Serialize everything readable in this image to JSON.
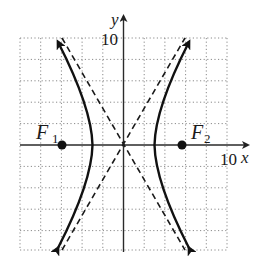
{
  "figure": {
    "type": "hyperbola-graph",
    "equation": "x^2/9 - y^2/27 = 1",
    "axes": {
      "x_label": "x",
      "y_label": "y",
      "x_tick_label": "10",
      "y_tick_label": "10",
      "x_range": [
        -10,
        10
      ],
      "y_range": [
        -10,
        10
      ],
      "grid_step": 2,
      "grid_style": "dotted"
    },
    "foci": [
      {
        "name": "F",
        "sub": "1",
        "x": -6,
        "y": 0
      },
      {
        "name": "F",
        "sub": "2",
        "x": 6,
        "y": 0
      }
    ],
    "vertices": [
      {
        "x": -3,
        "y": 0
      },
      {
        "x": 3,
        "y": 0
      }
    ],
    "asymptotes": {
      "style": "dashed",
      "slopes": [
        1.73,
        -1.73
      ]
    },
    "colors": {
      "curve": "#1a1a1a",
      "grid": "#888888",
      "axis": "#333333",
      "background": "#ffffff"
    }
  }
}
